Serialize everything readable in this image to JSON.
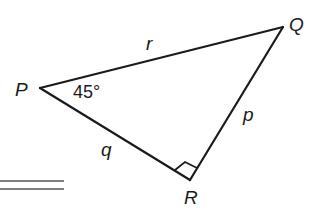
{
  "diagram": {
    "type": "right-triangle",
    "stroke_color": "#1a1a1a",
    "vertices": {
      "P": {
        "label": "P",
        "x": 40,
        "y": 88
      },
      "Q": {
        "label": "Q",
        "x": 283,
        "y": 27
      },
      "R": {
        "label": "R",
        "x": 190,
        "y": 180
      }
    },
    "sides": {
      "r": {
        "label": "r",
        "from": "P",
        "to": "Q"
      },
      "q": {
        "label": "q",
        "from": "P",
        "to": "R"
      },
      "p": {
        "label": "p",
        "from": "Q",
        "to": "R"
      }
    },
    "angle_P": {
      "label": "45°"
    },
    "right_angle_at": "R",
    "double_rule": {
      "x1": 0,
      "x2": 64,
      "y1": 181,
      "y2": 189
    }
  }
}
